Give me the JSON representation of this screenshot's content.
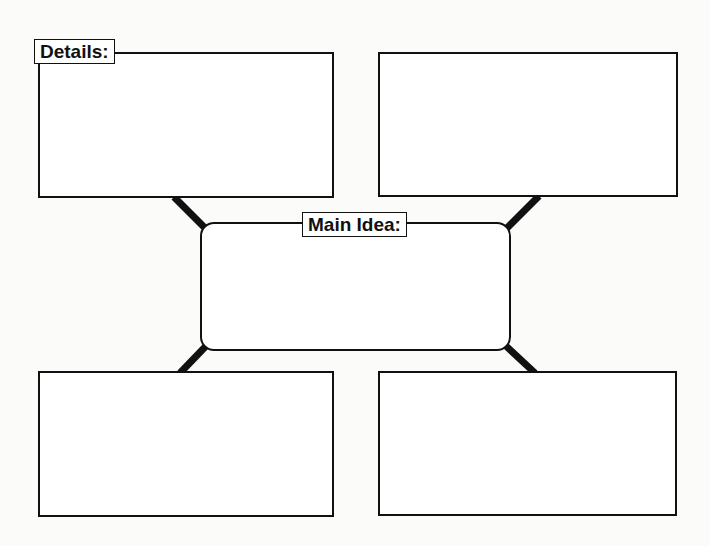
{
  "organizer": {
    "details_label": "Details:",
    "main_idea_label": "Main Idea:",
    "detail_boxes": [
      {
        "position": "top-left",
        "content": ""
      },
      {
        "position": "top-right",
        "content": ""
      },
      {
        "position": "bottom-left",
        "content": ""
      },
      {
        "position": "bottom-right",
        "content": ""
      }
    ],
    "main_idea_content": "",
    "colors": {
      "line": "#111111",
      "background": "#fbfbf9",
      "box_fill": "#ffffff"
    }
  }
}
